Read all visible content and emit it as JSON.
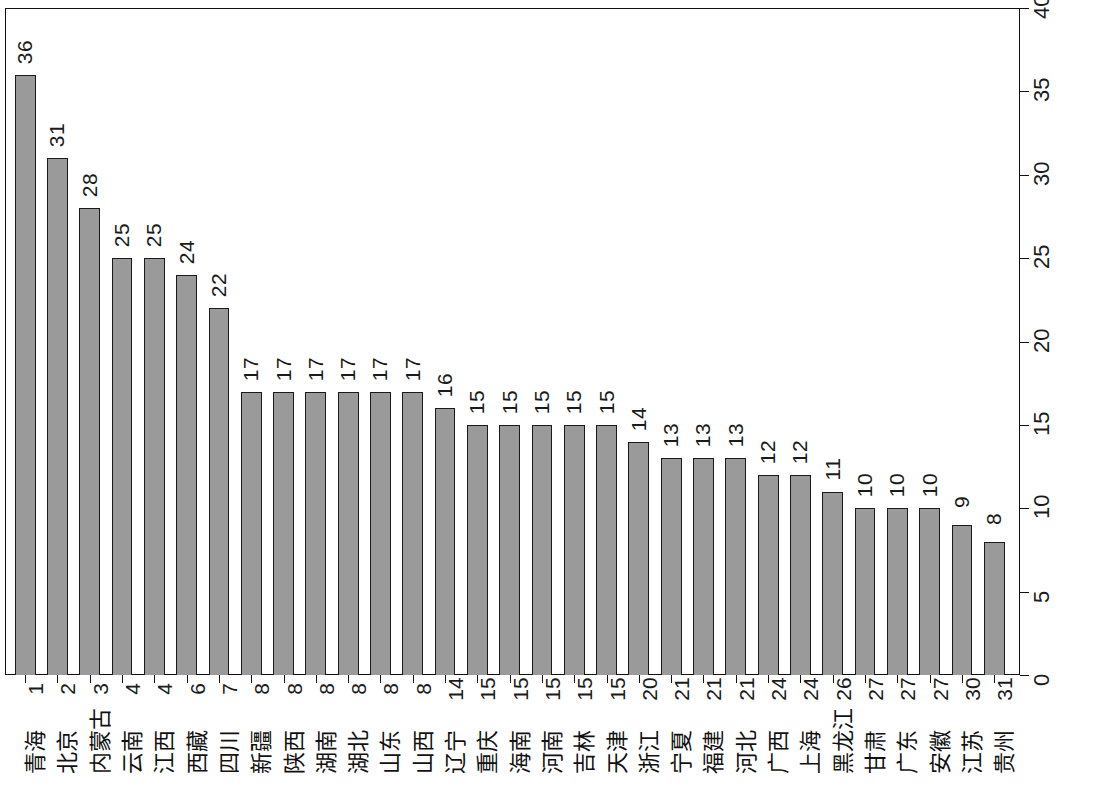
{
  "chart_data": {
    "type": "bar",
    "title": "",
    "subtitle": "",
    "xlabel": "",
    "ylabel": "",
    "ylim": [
      0,
      40
    ],
    "ytick_step": 5,
    "yticks": [
      "0",
      "5",
      "10",
      "15",
      "20",
      "25",
      "30",
      "35",
      "40"
    ],
    "grid": false,
    "legend": null,
    "legend_position": "none",
    "orientation": "vertical-bars-rotated-labels",
    "axis_position": "value-axis-right",
    "bar_fill_color": "#9a9a9a",
    "bar_border_color": "#1a1a1a",
    "background_color": "#ffffff",
    "categories": [
      "青海",
      "北京",
      "内蒙古",
      "云南",
      "江西",
      "西藏",
      "四川",
      "新疆",
      "陕西",
      "湖南",
      "湖北",
      "山东",
      "山西",
      "辽宁",
      "重庆",
      "海南",
      "河南",
      "吉林",
      "天津",
      "浙江",
      "宁夏",
      "福建",
      "河北",
      "广西",
      "上海",
      "黑龙江",
      "甘肃",
      "广东",
      "安徽",
      "江苏",
      "贵州"
    ],
    "ranks": [
      "1",
      "2",
      "3",
      "4",
      "4",
      "6",
      "7",
      "8",
      "8",
      "8",
      "8",
      "8",
      "8",
      "14",
      "15",
      "15",
      "15",
      "15",
      "15",
      "20",
      "21",
      "21",
      "21",
      "24",
      "24",
      "26",
      "27",
      "27",
      "27",
      "30",
      "31"
    ],
    "values": [
      36,
      31,
      28,
      25,
      25,
      24,
      22,
      17,
      17,
      17,
      17,
      17,
      17,
      16,
      15,
      15,
      15,
      15,
      15,
      14,
      13,
      13,
      13,
      12,
      12,
      11,
      10,
      10,
      10,
      9,
      8
    ],
    "value_labels": [
      "36",
      "31",
      "28",
      "25",
      "25",
      "24",
      "22",
      "17",
      "17",
      "17",
      "17",
      "17",
      "17",
      "16",
      "15",
      "15",
      "15",
      "15",
      "15",
      "14",
      "13",
      "13",
      "13",
      "12",
      "12",
      "11",
      "10",
      "10",
      "10",
      "9",
      "8"
    ]
  }
}
